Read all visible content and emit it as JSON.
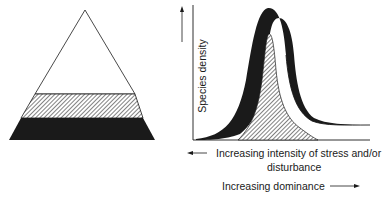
{
  "figure": {
    "left_panel": {
      "name": "dominance-pyramid",
      "layers": [
        {
          "name": "top",
          "fill": "white"
        },
        {
          "name": "middle",
          "fill": "hatched"
        },
        {
          "name": "bottom",
          "fill": "black"
        }
      ]
    },
    "right_panel": {
      "y_axis_label": "Species density",
      "x_axis_label_line1": "Increasing intensity of stress and/or",
      "x_axis_label_line2": "disturbance",
      "secondary_label": "Increasing dominance",
      "curves": [
        {
          "name": "total-species",
          "style": "outline"
        },
        {
          "name": "black-band",
          "style": "black"
        },
        {
          "name": "hatched-band",
          "style": "hatched"
        }
      ]
    },
    "colors": {
      "ink": "#1a1a1a",
      "background": "#ffffff"
    }
  }
}
